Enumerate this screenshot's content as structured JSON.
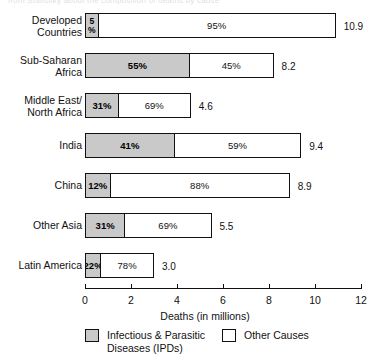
{
  "caption": "from Statistiky about the composition of deaths by cause",
  "chart_data": {
    "type": "bar",
    "orientation": "horizontal",
    "stacked": true,
    "stacked_normalized": true,
    "title": "",
    "xlabel": "Deaths (in millions)",
    "ylabel": "",
    "xlim": [
      0,
      12
    ],
    "xticks": [
      0,
      2,
      4,
      6,
      8,
      10,
      12
    ],
    "xtick_labels": [
      "0",
      "2",
      "4",
      "6",
      "8",
      "10",
      "12"
    ],
    "grid": false,
    "legend_position": "bottom",
    "categories": [
      "Developed Countries",
      "Sub-Saharan Africa",
      "Middle East/ North Africa",
      "India",
      "China",
      "Other Asia",
      "Latin America"
    ],
    "series": [
      {
        "name": "Infectious & Parasitic Diseases (IPDs)",
        "values": [
          5,
          55,
          31,
          41,
          12,
          31,
          22
        ],
        "unit": "percent",
        "labels": [
          "5\n%",
          "55%",
          "31%",
          "41%",
          "12%",
          "31%",
          "22%"
        ]
      },
      {
        "name": "Other Causes",
        "values": [
          95,
          45,
          69,
          59,
          88,
          69,
          78
        ],
        "unit": "percent",
        "labels": [
          "95%",
          "45%",
          "69%",
          "59%",
          "88%",
          "69%",
          "78%"
        ]
      }
    ],
    "totals": [
      10.9,
      8.2,
      4.6,
      9.4,
      8.9,
      5.5,
      3.0
    ],
    "total_labels": [
      "10.9",
      "8.2",
      "4.6",
      "9.4",
      "8.9",
      "5.5",
      "3.0"
    ],
    "totals_unit": "millions of deaths"
  },
  "rows": [
    {
      "label": "Developed\nCountries",
      "ipd_pct": 5,
      "other_pct": 95,
      "ipd_label": "5\n%",
      "other_label": "95%",
      "total_label": "10.9",
      "total": 10.9,
      "narrow": true
    },
    {
      "label": "Sub-Saharan\nAfrica",
      "ipd_pct": 55,
      "other_pct": 45,
      "ipd_label": "55%",
      "other_label": "45%",
      "total_label": "8.2",
      "total": 8.2,
      "narrow": false
    },
    {
      "label": "Middle East/\nNorth Africa",
      "ipd_pct": 31,
      "other_pct": 69,
      "ipd_label": "31%",
      "other_label": "69%",
      "total_label": "4.6",
      "total": 4.6,
      "narrow": false
    },
    {
      "label": "India",
      "ipd_pct": 41,
      "other_pct": 59,
      "ipd_label": "41%",
      "other_label": "59%",
      "total_label": "9.4",
      "total": 9.4,
      "narrow": false
    },
    {
      "label": "China",
      "ipd_pct": 12,
      "other_pct": 88,
      "ipd_label": "12%",
      "other_label": "88%",
      "total_label": "8.9",
      "total": 8.9,
      "narrow": false
    },
    {
      "label": "Other Asia",
      "ipd_pct": 31,
      "other_pct": 69,
      "ipd_label": "31%",
      "other_label": "69%",
      "total_label": "5.5",
      "total": 5.5,
      "narrow": false
    },
    {
      "label": "Latin America",
      "ipd_pct": 22,
      "other_pct": 78,
      "ipd_label": "22%",
      "other_label": "78%",
      "total_label": "3.0",
      "total": 3.0,
      "narrow": false
    }
  ],
  "axis": {
    "title": "Deaths (in millions)",
    "ticks": [
      "0",
      "2",
      "4",
      "6",
      "8",
      "10",
      "12"
    ]
  },
  "legend": {
    "items": [
      {
        "label": "Infectious & Parasitic\nDiseases (IPDs)",
        "swatch": "stipple-fill"
      },
      {
        "label": "Other Causes",
        "swatch": "white-fill"
      }
    ]
  },
  "colors": {
    "ink": "#111111",
    "ipd_fill": "#c9c9c9",
    "other_fill": "#ffffff",
    "background": "#ffffff"
  }
}
